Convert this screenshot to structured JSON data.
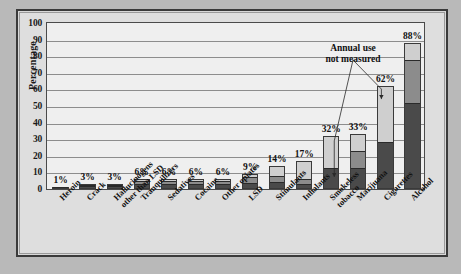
{
  "chart_data": {
    "type": "bar",
    "title": "Twelfth-graders",
    "xlabel": "",
    "ylabel": "Percentage",
    "ylim": [
      0,
      100
    ],
    "ytick_step": 10,
    "yticks": [
      "0",
      "10",
      "20",
      "30",
      "40",
      "50",
      "60",
      "70",
      "80",
      "90",
      "100"
    ],
    "grid": true,
    "legend_position": "none",
    "stacked": true,
    "categories": [
      "Heroin",
      "Crack",
      "Hallucinogens\nother than LSD",
      "Tranquilizers",
      "Sedatives",
      "Cocaine",
      "Other opiates",
      "LSD",
      "Stimulants",
      "Inhalants",
      "Smokeless\ntobacco",
      "Marijuana",
      "Cigarettes",
      "Alcohol"
    ],
    "series": [
      {
        "name": "30-day use",
        "color": "#4a4a4a",
        "values": [
          0.5,
          1.1,
          1.0,
          2.5,
          2.5,
          2.4,
          2.4,
          3.1,
          3.4,
          2.3,
          12.0,
          12.0,
          28.0,
          51.0
        ]
      },
      {
        "name": "Annual use",
        "color": "#8c8c8c",
        "values": [
          0.8,
          2.0,
          2.0,
          4.5,
          4.5,
          4.5,
          4.5,
          6.5,
          7.0,
          5.5,
          null,
          22.0,
          null,
          77.0
        ]
      },
      {
        "name": "Lifetime use",
        "color": "#cfcfcf",
        "values": [
          1,
          3,
          3,
          6,
          6,
          6,
          6,
          9,
          14,
          17,
          32,
          33,
          62,
          88
        ]
      }
    ],
    "data_labels": [
      "1%",
      "3%",
      "3%",
      "6%",
      "6%",
      "6%",
      "6%",
      "9%",
      "14%",
      "17%",
      "32%",
      "33%",
      "62%",
      "88%"
    ],
    "annotations": [
      {
        "text": "Annual use\nnot measured",
        "text_line1": "Annual use",
        "text_line2": "not measured",
        "points_to": [
          "Smokeless tobacco",
          "Cigarettes"
        ]
      }
    ]
  },
  "chart": {
    "title": "Twelfth-graders",
    "ylabel": "Percentage",
    "annotation_line1": "Annual use",
    "annotation_line2": "not measured"
  },
  "axis": {
    "yticks": [
      "100",
      "90",
      "80",
      "70",
      "60",
      "50",
      "40",
      "30",
      "20",
      "10",
      "0"
    ]
  },
  "bars": [
    {
      "label_line1": "Heroin",
      "label_line2": "",
      "value_label": "1%",
      "total": 1,
      "seg30": 0.5,
      "segAnnual": 0.8
    },
    {
      "label_line1": "Crack",
      "label_line2": "",
      "value_label": "3%",
      "total": 3,
      "seg30": 1.1,
      "segAnnual": 2.0
    },
    {
      "label_line1": "Hallucinogens",
      "label_line2": "other than LSD",
      "value_label": "3%",
      "total": 3,
      "seg30": 1.0,
      "segAnnual": 2.0
    },
    {
      "label_line1": "Tranquilizers",
      "label_line2": "",
      "value_label": "6%",
      "total": 6,
      "seg30": 2.5,
      "segAnnual": 4.5
    },
    {
      "label_line1": "Sedatives",
      "label_line2": "",
      "value_label": "6%",
      "total": 6,
      "seg30": 2.5,
      "segAnnual": 4.5
    },
    {
      "label_line1": "Cocaine",
      "label_line2": "",
      "value_label": "6%",
      "total": 6,
      "seg30": 2.4,
      "segAnnual": 4.5
    },
    {
      "label_line1": "Other opiates",
      "label_line2": "",
      "value_label": "6%",
      "total": 6,
      "seg30": 2.4,
      "segAnnual": 4.5
    },
    {
      "label_line1": "LSD",
      "label_line2": "",
      "value_label": "9%",
      "total": 9,
      "seg30": 3.1,
      "segAnnual": 6.5
    },
    {
      "label_line1": "Stimulants",
      "label_line2": "",
      "value_label": "14%",
      "total": 14,
      "seg30": 3.4,
      "segAnnual": 7.0
    },
    {
      "label_line1": "Inhalants",
      "label_line2": "",
      "value_label": "17%",
      "total": 17,
      "seg30": 2.3,
      "segAnnual": 5.5
    },
    {
      "label_line1": "Smokeless",
      "label_line2": "tobacco",
      "value_label": "32%",
      "total": 32,
      "seg30": 12.0,
      "segAnnual": null
    },
    {
      "label_line1": "Marijuana",
      "label_line2": "",
      "value_label": "33%",
      "total": 33,
      "seg30": 12.0,
      "segAnnual": 22.0
    },
    {
      "label_line1": "Cigarettes",
      "label_line2": "",
      "value_label": "62%",
      "total": 62,
      "seg30": 28.0,
      "segAnnual": null
    },
    {
      "label_line1": "Alcohol",
      "label_line2": "",
      "value_label": "88%",
      "total": 88,
      "seg30": 51.0,
      "segAnnual": 77.0
    }
  ]
}
